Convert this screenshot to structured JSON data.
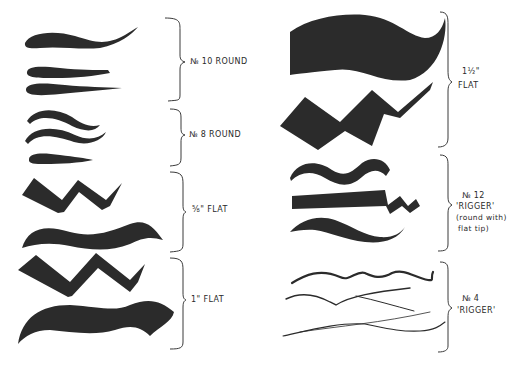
{
  "figure": {
    "ink_color": "#2b2b2b",
    "background": "#ffffff"
  },
  "left_column": {
    "groups": [
      {
        "id": "no10-round",
        "label": "No 10 ROUND",
        "label_parts": [
          "№ 10 ROUND"
        ],
        "strokes": 3
      },
      {
        "id": "no8-round",
        "label": "No 8 ROUND",
        "label_parts": [
          "№ 8 ROUND"
        ],
        "strokes": 3
      },
      {
        "id": "five-eighths-flat",
        "label": "5/8\" FLAT",
        "label_parts": [
          "⅝\" FLAT"
        ],
        "strokes": 2
      },
      {
        "id": "one-inch-flat",
        "label": "1\" FLAT",
        "label_parts": [
          "1\" FLAT"
        ],
        "strokes": 2
      }
    ]
  },
  "right_column": {
    "groups": [
      {
        "id": "one-half-flat",
        "label": "1 1/2\" FLAT",
        "label_parts": [
          "1½\"",
          "FLAT"
        ],
        "strokes": 2
      },
      {
        "id": "no12-rigger",
        "label": "No 12 'RIGGER' (round with flat tip)",
        "label_parts": [
          "№ 12",
          "'RIGGER'",
          "(round with)",
          "flat tip)"
        ],
        "strokes": 3
      },
      {
        "id": "no4-rigger",
        "label": "No 4 'RIGGER'",
        "label_parts": [
          "№ 4",
          "'RIGGER'"
        ],
        "strokes": 4
      }
    ]
  }
}
